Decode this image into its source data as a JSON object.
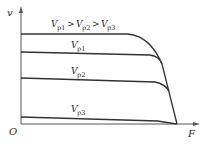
{
  "diagram": {
    "title_relation": "V_p1 > V_p2 > V_p3",
    "axes": {
      "y_label": "v",
      "x_label": "F",
      "origin_label": "O"
    },
    "curves": [
      {
        "name": "envelope",
        "label": ""
      },
      {
        "name": "Vp1",
        "label_main": "V",
        "label_sub": "p1"
      },
      {
        "name": "Vp2",
        "label_main": "V",
        "label_sub": "p2"
      },
      {
        "name": "Vp3",
        "label_main": "V",
        "label_sub": "p3"
      }
    ],
    "relation": {
      "parts": [
        {
          "main": "V",
          "sub": "p1"
        },
        {
          "op": ">"
        },
        {
          "main": "V",
          "sub": "p2"
        },
        {
          "op": ">"
        },
        {
          "main": "V",
          "sub": "p3"
        }
      ]
    },
    "colors": {
      "line": "#333333",
      "axis": "#555555",
      "background": "#ffffff"
    }
  }
}
